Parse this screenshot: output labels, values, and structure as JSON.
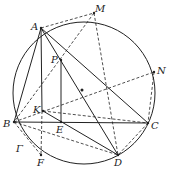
{
  "diagram": {
    "type": "geometry",
    "circle": {
      "name": "Γ",
      "cx": 84,
      "cy": 93,
      "r": 71
    },
    "center_dot": {
      "x": 82,
      "y": 90
    },
    "points": [
      {
        "id": "A",
        "x": 41,
        "y": 28,
        "lx": 31,
        "ly": 22
      },
      {
        "id": "M",
        "x": 94,
        "y": 13,
        "lx": 95,
        "ly": 4
      },
      {
        "id": "P",
        "x": 61,
        "y": 60,
        "lx": 51,
        "ly": 55
      },
      {
        "id": "N",
        "x": 154,
        "y": 72,
        "lx": 157,
        "ly": 66
      },
      {
        "id": "K",
        "x": 43,
        "y": 111,
        "lx": 33,
        "ly": 105
      },
      {
        "id": "B",
        "x": 14,
        "y": 122,
        "lx": 3,
        "ly": 119
      },
      {
        "id": "E",
        "x": 61,
        "y": 122,
        "lx": 56,
        "ly": 125
      },
      {
        "id": "C",
        "x": 148,
        "y": 123,
        "lx": 151,
        "ly": 121
      },
      {
        "id": "D",
        "x": 118,
        "y": 155,
        "lx": 114,
        "ly": 158
      },
      {
        "id": "F",
        "x": 41,
        "y": 155,
        "lx": 37,
        "ly": 158
      }
    ],
    "gamma_label": {
      "text": "Γ",
      "x": 16,
      "y": 144
    },
    "solid_segments": [
      [
        "A",
        "B"
      ],
      [
        "A",
        "C"
      ],
      [
        "A",
        "D"
      ],
      [
        "A",
        "F_top"
      ],
      [
        "B",
        "C"
      ],
      [
        "P",
        "E"
      ],
      [
        "K",
        "D"
      ]
    ],
    "dashed_segments": [
      [
        "A",
        "M"
      ],
      [
        "M",
        "B"
      ],
      [
        "M",
        "D"
      ],
      [
        "B",
        "N"
      ],
      [
        "N",
        "C"
      ],
      [
        "B",
        "D"
      ],
      [
        "K",
        "C"
      ],
      [
        "C",
        "D"
      ],
      [
        "K",
        "F"
      ],
      [
        "B",
        "F"
      ]
    ]
  }
}
